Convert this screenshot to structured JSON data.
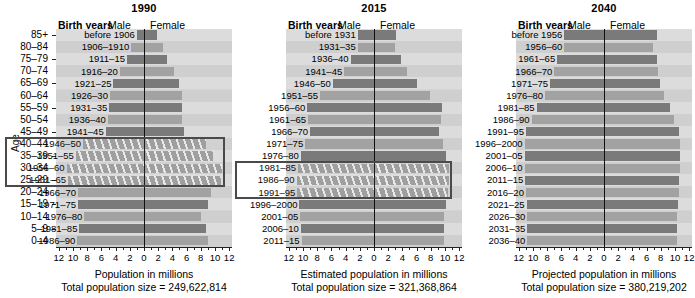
{
  "figure": {
    "axis_y_label": "Age",
    "age_groups": [
      "85+",
      "80–84",
      "75–79",
      "70–74",
      "65–69",
      "60–64",
      "55–59",
      "50–54",
      "45–49",
      "40–44",
      "35–39",
      "30–34",
      "25–29",
      "20–24",
      "15–19",
      "10–14",
      "5–9",
      "0–4"
    ],
    "x_tick_labels": [
      "12",
      "10",
      "8",
      "6",
      "4",
      "2",
      "0",
      "2",
      "4",
      "6",
      "8",
      "10",
      "12"
    ],
    "header": {
      "birth_years": "Birth years",
      "male": "Male",
      "female": "Female"
    }
  },
  "chart_data": {
    "type": "bar",
    "ylabel": "Age",
    "xlim": [
      -12,
      12
    ],
    "grid": false,
    "legend": "none",
    "units": "millions",
    "panels": [
      {
        "year": "1990",
        "xlabel": "Population in millions",
        "total_label": "Total population size = 249,622,814",
        "total_population": 249622814,
        "categories": [
          "85+",
          "80–84",
          "75–79",
          "70–74",
          "65–69",
          "60–64",
          "55–59",
          "50–54",
          "45–49",
          "40–44",
          "35–39",
          "30–34",
          "25–29",
          "20–24",
          "15–19",
          "10–14",
          "5–9",
          "0–4"
        ],
        "birth_years": [
          "before 1906",
          "1906–1910",
          "1911–15",
          "1916–20",
          "1921–25",
          "1926–30",
          "1931–35",
          "1936–40",
          "1941–45",
          "1946–50",
          "1951–55",
          "1956–60",
          "1961–65",
          "1966–70",
          "1971–75",
          "1976–80",
          "1981–85",
          "1986–90"
        ],
        "male": [
          1.0,
          1.8,
          2.4,
          3.4,
          4.3,
          4.8,
          4.9,
          5.1,
          5.4,
          8.6,
          9.6,
          10.9,
          10.7,
          9.3,
          9.3,
          8.4,
          9.1,
          9.4
        ],
        "female": [
          1.8,
          2.7,
          3.3,
          4.2,
          5.0,
          5.3,
          5.3,
          5.4,
          5.6,
          8.7,
          9.7,
          11.0,
          10.8,
          9.4,
          9.0,
          8.1,
          8.7,
          9.0
        ],
        "highlight": {
          "label": "baby boomers",
          "from_age": "40–44",
          "to_age": "25–29"
        }
      },
      {
        "year": "2015",
        "xlabel": "Estimated population in millions",
        "total_label": "Total population size = 321,368,864",
        "total_population": 321368864,
        "categories": [
          "85+",
          "80–84",
          "75–79",
          "70–74",
          "65–69",
          "60–64",
          "55–59",
          "50–54",
          "45–49",
          "40–44",
          "35–39",
          "30–34",
          "25–29",
          "20–24",
          "15–19",
          "10–14",
          "5–9",
          "0–4"
        ],
        "birth_years": [
          "before 1931",
          "1931–35",
          "1936–40",
          "1941–45",
          "1946–50",
          "1951–55",
          "1956–60",
          "1961–65",
          "1966–70",
          "1971–75",
          "1976–80",
          "1981–85",
          "1986–90",
          "1991–95",
          "1996–2000",
          "2001–05",
          "2006–10",
          "2011–15"
        ],
        "male": [
          2.3,
          2.3,
          3.3,
          4.2,
          5.8,
          7.6,
          9.4,
          9.3,
          9.0,
          9.7,
          10.3,
          10.7,
          10.9,
          10.8,
          10.5,
          10.4,
          10.3,
          10.2
        ],
        "female": [
          3.1,
          3.0,
          3.8,
          4.7,
          6.1,
          7.9,
          9.6,
          9.5,
          9.2,
          9.7,
          10.2,
          10.5,
          10.6,
          10.4,
          10.1,
          9.9,
          9.9,
          9.8
        ],
        "highlight": {
          "label": "millennials",
          "from_age": "30–34",
          "to_age": "20–24"
        }
      },
      {
        "year": "2040",
        "xlabel": "Projected population in millions",
        "total_label": "Total population size = 380,219,202",
        "total_population": 380219202,
        "categories": [
          "85+",
          "80–84",
          "75–79",
          "70–74",
          "65–69",
          "60–64",
          "55–59",
          "50–54",
          "45–49",
          "40–44",
          "35–39",
          "30–34",
          "25–29",
          "20–24",
          "15–19",
          "10–14",
          "5–9",
          "0–4"
        ],
        "birth_years": [
          "before 1956",
          "1956–60",
          "1961–65",
          "1966–70",
          "1971–75",
          "1976–80",
          "1981–85",
          "1986–90",
          "1991–95",
          "1996–2000",
          "2001–05",
          "2006–10",
          "2011–15",
          "2016–20",
          "2021–25",
          "2026–30",
          "2031–35",
          "2036–40"
        ],
        "male": [
          5.6,
          5.6,
          6.6,
          7.0,
          7.6,
          8.3,
          9.5,
          10.2,
          11.0,
          11.2,
          11.2,
          11.2,
          11.1,
          11.0,
          10.9,
          10.8,
          10.8,
          10.8
        ],
        "female": [
          7.4,
          6.9,
          7.5,
          7.6,
          7.9,
          8.4,
          9.3,
          9.9,
          10.5,
          10.7,
          10.7,
          10.7,
          10.6,
          10.5,
          10.4,
          10.3,
          10.3,
          10.3
        ],
        "highlight": null
      }
    ]
  }
}
